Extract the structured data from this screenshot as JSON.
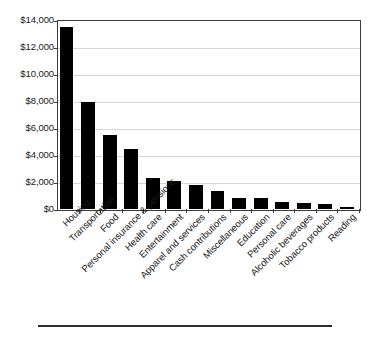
{
  "chart_data": {
    "type": "bar",
    "title": "",
    "subtitle": "",
    "xlabel": "",
    "ylabel": "",
    "categories": [
      "Housing",
      "Transportation",
      "Food",
      "Personal insurance & pensions",
      "Health care",
      "Entertainment",
      "Apparel and services",
      "Cash contributions",
      "Miscellaneous",
      "Education",
      "Personal care",
      "Alcoholic beverages",
      "Tobacco products",
      "Reading"
    ],
    "values": [
      13480,
      7950,
      5480,
      4450,
      2300,
      2040,
      1790,
      1330,
      810,
      780,
      540,
      440,
      390,
      120
    ],
    "ylim": [
      0,
      14000
    ],
    "yticks": [
      0,
      2000,
      4000,
      6000,
      8000,
      10000,
      12000,
      14000
    ],
    "ytick_labels": [
      "$0",
      "$2,000",
      "$4,000",
      "$6,000",
      "$8,000",
      "$10,000",
      "$12,000",
      "$14,000"
    ],
    "grid": true,
    "legend": "none",
    "bar_color": "#000000",
    "gridline_color": "#d6d6d6",
    "axis_color": "#3c3c3c",
    "background_color": "#ffffff",
    "annotations": []
  },
  "figure": {
    "bottom_rule_color": "#2b2b2b"
  }
}
